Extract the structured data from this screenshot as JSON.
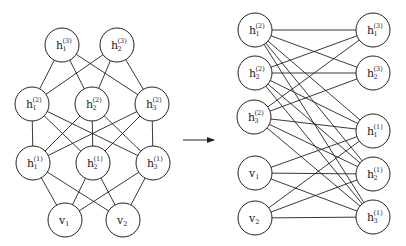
{
  "diagram": {
    "left_graph": {
      "name": "layered",
      "nodes": [
        {
          "id": "L_h1_3",
          "base": "h",
          "sub": "1",
          "sup": "(3)",
          "x": 62,
          "y": 45
        },
        {
          "id": "L_h2_3",
          "base": "h",
          "sub": "2",
          "sup": "(3)",
          "x": 117,
          "y": 45
        },
        {
          "id": "L_h1_2",
          "base": "h",
          "sub": "1",
          "sup": "(2)",
          "x": 32,
          "y": 104
        },
        {
          "id": "L_h2_2",
          "base": "h",
          "sub": "2",
          "sup": "(2)",
          "x": 92,
          "y": 104
        },
        {
          "id": "L_h3_2",
          "base": "h",
          "sub": "3",
          "sup": "(2)",
          "x": 152,
          "y": 104
        },
        {
          "id": "L_h1_1",
          "base": "h",
          "sub": "1",
          "sup": "(1)",
          "x": 33,
          "y": 163
        },
        {
          "id": "L_h2_1",
          "base": "h",
          "sub": "2",
          "sup": "(1)",
          "x": 93,
          "y": 163
        },
        {
          "id": "L_h3_1",
          "base": "h",
          "sub": "3",
          "sup": "(1)",
          "x": 153,
          "y": 163
        },
        {
          "id": "L_v1",
          "base": "v",
          "sub": "1",
          "sup": "",
          "x": 65,
          "y": 220
        },
        {
          "id": "L_v2",
          "base": "v",
          "sub": "2",
          "sup": "",
          "x": 123,
          "y": 220
        }
      ],
      "edges": [
        [
          "L_h1_3",
          "L_h1_2"
        ],
        [
          "L_h1_3",
          "L_h2_2"
        ],
        [
          "L_h1_3",
          "L_h3_2"
        ],
        [
          "L_h2_3",
          "L_h1_2"
        ],
        [
          "L_h2_3",
          "L_h2_2"
        ],
        [
          "L_h2_3",
          "L_h3_2"
        ],
        [
          "L_h1_2",
          "L_h1_1"
        ],
        [
          "L_h1_2",
          "L_h2_1"
        ],
        [
          "L_h1_2",
          "L_h3_1"
        ],
        [
          "L_h2_2",
          "L_h1_1"
        ],
        [
          "L_h2_2",
          "L_h2_1"
        ],
        [
          "L_h2_2",
          "L_h3_1"
        ],
        [
          "L_h3_2",
          "L_h1_1"
        ],
        [
          "L_h3_2",
          "L_h2_1"
        ],
        [
          "L_h3_2",
          "L_h3_1"
        ],
        [
          "L_h1_1",
          "L_v1"
        ],
        [
          "L_h1_1",
          "L_v2"
        ],
        [
          "L_h2_1",
          "L_v1"
        ],
        [
          "L_h2_1",
          "L_v2"
        ],
        [
          "L_h3_1",
          "L_v1"
        ],
        [
          "L_h3_1",
          "L_v2"
        ]
      ]
    },
    "arrow": {
      "x1": 183,
      "y1": 140,
      "x2": 214,
      "y2": 140
    },
    "right_graph": {
      "name": "bipartite",
      "nodes": [
        {
          "id": "R_h1_2",
          "base": "h",
          "sub": "1",
          "sup": "(2)",
          "x": 255,
          "y": 30
        },
        {
          "id": "R_h2_2",
          "base": "h",
          "sub": "2",
          "sup": "(2)",
          "x": 255,
          "y": 73
        },
        {
          "id": "R_h3_2",
          "base": "h",
          "sub": "3",
          "sup": "(2)",
          "x": 254,
          "y": 117
        },
        {
          "id": "R_v1",
          "base": "v",
          "sub": "1",
          "sup": "",
          "x": 255,
          "y": 173
        },
        {
          "id": "R_v2",
          "base": "v",
          "sub": "2",
          "sup": "",
          "x": 255,
          "y": 218
        },
        {
          "id": "R_h1_3",
          "base": "h",
          "sub": "1",
          "sup": "(3)",
          "x": 373,
          "y": 30
        },
        {
          "id": "R_h2_3",
          "base": "h",
          "sub": "2",
          "sup": "(3)",
          "x": 373,
          "y": 73
        },
        {
          "id": "R_h1_1",
          "base": "h",
          "sub": "1",
          "sup": "(1)",
          "x": 373,
          "y": 131
        },
        {
          "id": "R_h2_1",
          "base": "h",
          "sub": "2",
          "sup": "(1)",
          "x": 373,
          "y": 174
        },
        {
          "id": "R_h3_1",
          "base": "h",
          "sub": "3",
          "sup": "(1)",
          "x": 373,
          "y": 217
        }
      ],
      "edges": [
        [
          "R_h1_2",
          "R_h1_3"
        ],
        [
          "R_h1_2",
          "R_h2_3"
        ],
        [
          "R_h2_2",
          "R_h1_3"
        ],
        [
          "R_h2_2",
          "R_h2_3"
        ],
        [
          "R_h3_2",
          "R_h1_3"
        ],
        [
          "R_h3_2",
          "R_h2_3"
        ],
        [
          "R_h1_2",
          "R_h1_1"
        ],
        [
          "R_h1_2",
          "R_h2_1"
        ],
        [
          "R_h1_2",
          "R_h3_1"
        ],
        [
          "R_h2_2",
          "R_h1_1"
        ],
        [
          "R_h2_2",
          "R_h2_1"
        ],
        [
          "R_h2_2",
          "R_h3_1"
        ],
        [
          "R_h3_2",
          "R_h1_1"
        ],
        [
          "R_h3_2",
          "R_h2_1"
        ],
        [
          "R_h3_2",
          "R_h3_1"
        ],
        [
          "R_v1",
          "R_h1_1"
        ],
        [
          "R_v1",
          "R_h2_1"
        ],
        [
          "R_v1",
          "R_h3_1"
        ],
        [
          "R_v2",
          "R_h1_1"
        ],
        [
          "R_v2",
          "R_h2_1"
        ],
        [
          "R_v2",
          "R_h3_1"
        ]
      ]
    },
    "node_radius": 17,
    "colors": {
      "stroke": "#222222",
      "fill": "#ffffff",
      "background": "#ffffff"
    }
  }
}
